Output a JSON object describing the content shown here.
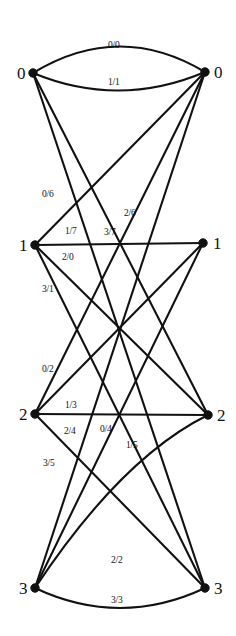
{
  "figure": {
    "type": "bipartite-trellis-graph",
    "background_color": "#ffffff",
    "line_color": "#111111",
    "width": 236,
    "height": 636
  },
  "left_nodes": [
    {
      "label": "0",
      "x": 33,
      "y": 73,
      "label_x": 17,
      "label_y": 79
    },
    {
      "label": "1",
      "x": 35,
      "y": 245,
      "label_x": 19,
      "label_y": 251
    },
    {
      "label": "2",
      "x": 35,
      "y": 414,
      "label_x": 19,
      "label_y": 420
    },
    {
      "label": "3",
      "x": 35,
      "y": 588,
      "label_x": 19,
      "label_y": 594
    }
  ],
  "right_nodes": [
    {
      "label": "0",
      "x": 205,
      "y": 72,
      "label_x": 214,
      "label_y": 78
    },
    {
      "label": "1",
      "x": 203,
      "y": 243,
      "label_x": 213,
      "label_y": 249
    },
    {
      "label": "2",
      "x": 208,
      "y": 415,
      "label_x": 217,
      "label_y": 421
    },
    {
      "label": "3",
      "x": 205,
      "y": 588,
      "label_x": 214,
      "label_y": 594
    }
  ],
  "edges": [
    {
      "id": "e-0-0-a",
      "from": 0,
      "to": 0,
      "label": "0/0",
      "label_x": 108,
      "label_y": 48,
      "curve": -26
    },
    {
      "id": "e-0-0-b",
      "from": 0,
      "to": 0,
      "label": "1/1",
      "label_x": 108,
      "label_y": 85,
      "curve": 18
    },
    {
      "id": "e-0-2",
      "from": 0,
      "to": 2,
      "label": "2/6",
      "label_x": 124,
      "label_y": 216,
      "curve": 0
    },
    {
      "id": "e-0-3",
      "from": 0,
      "to": 3,
      "label": "3/7",
      "label_x": 104,
      "label_y": 235,
      "curve": 0
    },
    {
      "id": "e-1-0",
      "from": 1,
      "to": 0,
      "label": "0/6",
      "label_x": 42,
      "label_y": 197,
      "curve": 0
    },
    {
      "id": "e-1-1",
      "from": 1,
      "to": 1,
      "label": "1/7",
      "label_x": 65,
      "label_y": 234,
      "curve": 0
    },
    {
      "id": "e-1-2",
      "from": 1,
      "to": 2,
      "label": "2/0",
      "label_x": 62,
      "label_y": 260,
      "curve": 0
    },
    {
      "id": "e-1-3",
      "from": 1,
      "to": 3,
      "label": "3/1",
      "label_x": 42,
      "label_y": 292,
      "curve": 0
    },
    {
      "id": "e-2-0",
      "from": 2,
      "to": 0,
      "label": "0/2",
      "label_x": 42,
      "label_y": 372,
      "curve": 0
    },
    {
      "id": "e-2-1",
      "from": 2,
      "to": 1,
      "label": "1/3",
      "label_x": 65,
      "label_y": 408,
      "curve": 0
    },
    {
      "id": "e-2-2",
      "from": 2,
      "to": 2,
      "label": "2/4",
      "label_x": 64,
      "label_y": 434,
      "curve": 0
    },
    {
      "id": "e-2-3",
      "from": 2,
      "to": 3,
      "label": "3/5",
      "label_x": 43,
      "label_y": 466,
      "curve": 0
    },
    {
      "id": "e-3-0",
      "from": 3,
      "to": 0,
      "label": "0/4",
      "label_x": 100,
      "label_y": 432,
      "curve": 0
    },
    {
      "id": "e-3-1",
      "from": 3,
      "to": 1,
      "label": "1/5",
      "label_x": 126,
      "label_y": 448,
      "curve": 0
    },
    {
      "id": "e-3-2",
      "from": 3,
      "to": 2,
      "label": "2/2",
      "label_x": 111,
      "label_y": 563,
      "curve": -22
    },
    {
      "id": "e-3-3",
      "from": 3,
      "to": 3,
      "label": "3/3",
      "label_x": 111,
      "label_y": 603,
      "curve": 20
    }
  ]
}
